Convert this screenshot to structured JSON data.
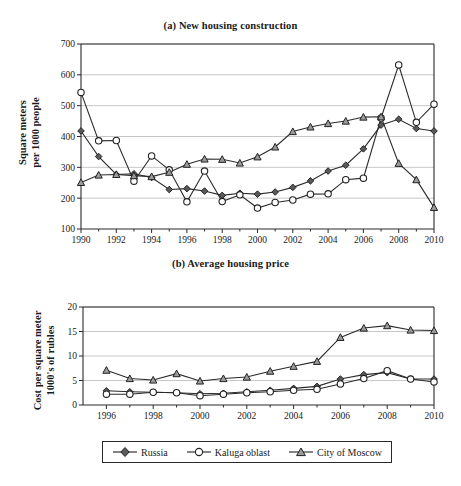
{
  "figure": {
    "panels": [
      {
        "key": "a",
        "title": "(a) New housing construction",
        "ylabel": "Square meters\nper 1000 people"
      },
      {
        "key": "b",
        "title": "(b) Average housing price",
        "ylabel": "Cost per square meter\n1000's of rubles"
      }
    ],
    "legend": {
      "items": [
        {
          "label": "Russia",
          "marker": "filled-diamond-icon",
          "color": "#5a5a5a"
        },
        {
          "label": "Kaluga oblast",
          "marker": "open-circle-icon",
          "color": "#ffffff"
        },
        {
          "label": "City of Moscow",
          "marker": "filled-triangle-icon",
          "color": "#9a9a9a"
        }
      ]
    }
  },
  "chart_data": [
    {
      "type": "line",
      "title": "(a) New housing construction",
      "xlabel": "",
      "ylabel": "Square meters per 1000 people",
      "x": [
        1990,
        1991,
        1992,
        1993,
        1994,
        1995,
        1996,
        1997,
        1998,
        1999,
        2000,
        2001,
        2002,
        2003,
        2004,
        2005,
        2006,
        2007,
        2008,
        2009,
        2010
      ],
      "xticklabels": [
        "1990",
        "1992",
        "1994",
        "1996",
        "1998",
        "2000",
        "2002",
        "2004",
        "2006",
        "2008",
        "2010"
      ],
      "xlim": [
        1990,
        2010
      ],
      "ylim": [
        100,
        700
      ],
      "yticks": [
        100,
        200,
        300,
        400,
        500,
        600,
        700
      ],
      "grid": "horizontal",
      "legend_position": "below-figure",
      "series": [
        {
          "name": "Russia",
          "marker": "filled-diamond",
          "values": [
            418,
            335,
            277,
            279,
            267,
            228,
            231,
            223,
            209,
            216,
            213,
            220,
            235,
            256,
            288,
            307,
            360,
            437,
            456,
            426,
            418
          ]
        },
        {
          "name": "Kaluga oblast",
          "marker": "open-circle",
          "values": [
            543,
            386,
            387,
            255,
            337,
            292,
            188,
            288,
            189,
            211,
            168,
            186,
            194,
            213,
            214,
            260,
            265,
            460,
            632,
            446,
            505
          ]
        },
        {
          "name": "City of Moscow",
          "marker": "filled-triangle",
          "values": [
            251,
            275,
            277,
            273,
            270,
            284,
            310,
            327,
            326,
            314,
            334,
            366,
            416,
            431,
            442,
            450,
            463,
            464,
            313,
            260,
            170
          ]
        }
      ]
    },
    {
      "type": "line",
      "title": "(b) Average housing price",
      "xlabel": "",
      "ylabel": "Cost per square meter 1000's of rubles",
      "x": [
        1996,
        1997,
        1998,
        1999,
        2000,
        2001,
        2002,
        2003,
        2004,
        2005,
        2006,
        2007,
        2008,
        2009,
        2010
      ],
      "xticklabels": [
        "1996",
        "1998",
        "2000",
        "2002",
        "2004",
        "2006",
        "2008",
        "2010"
      ],
      "xlim": [
        1995,
        2010
      ],
      "ylim": [
        0,
        20
      ],
      "yticks": [
        0,
        5,
        10,
        15,
        20
      ],
      "grid": "horizontal",
      "legend_position": "below-figure",
      "series": [
        {
          "name": "Russia",
          "marker": "filled-diamond",
          "values": [
            2.9,
            2.7,
            2.6,
            2.5,
            2.3,
            2.4,
            2.7,
            3.0,
            3.4,
            3.8,
            5.3,
            6.2,
            6.6,
            5.3,
            5.3
          ]
        },
        {
          "name": "Kaluga oblast",
          "marker": "open-circle",
          "values": [
            2.2,
            2.2,
            2.6,
            2.5,
            1.9,
            2.2,
            2.5,
            2.7,
            3.0,
            3.2,
            4.3,
            5.4,
            7.0,
            5.3,
            4.7
          ]
        },
        {
          "name": "City of Moscow",
          "marker": "filled-triangle",
          "values": [
            7.1,
            5.4,
            5.1,
            6.4,
            4.9,
            5.4,
            5.7,
            6.9,
            7.9,
            8.9,
            13.8,
            15.7,
            16.2,
            15.3,
            15.2
          ]
        }
      ]
    }
  ]
}
